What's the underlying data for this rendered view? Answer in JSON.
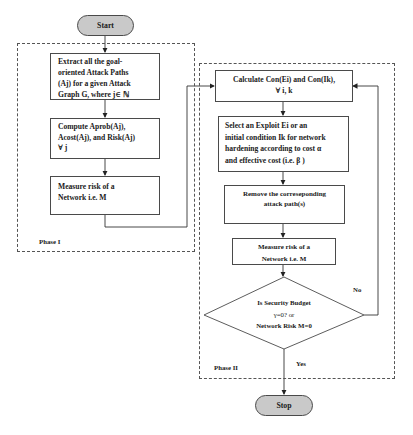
{
  "diagram": {
    "type": "flowchart",
    "terminals": {
      "start": "Start",
      "stop": "Stop"
    },
    "phase1": {
      "label": "Phase I",
      "steps": [
        {
          "id": "extract",
          "lines": [
            "Extract all the goal-",
            "oriented Attack Paths",
            "(Aj) for a given Attack",
            "Graph G, where j∈ ℕ"
          ]
        },
        {
          "id": "compute",
          "lines": [
            "Compute Aprob(Aj),",
            "Acost(Aj), and Risk(Aj)",
            "∀ j"
          ]
        },
        {
          "id": "measure1",
          "lines": [
            "Measure risk of a",
            "Network i.e. M"
          ]
        }
      ]
    },
    "phase2": {
      "label": "Phase II",
      "steps": [
        {
          "id": "calculate",
          "lines": [
            "Calculate Con(Ei) and Con(Ik),",
            "∀ i, k"
          ]
        },
        {
          "id": "select",
          "lines": [
            "Select an Exploit Ei or an",
            "initial condition Ik for network",
            "hardening according to cost α",
            "and effective cost (i.e. β )"
          ]
        },
        {
          "id": "remove",
          "lines": [
            "Remove the correseponding",
            "attack path(s)"
          ]
        },
        {
          "id": "measure2",
          "lines": [
            "Measure risk of a",
            "Network i.e. M"
          ]
        }
      ],
      "decision": {
        "lines": [
          "Is Security Budget",
          "γ=0? or",
          "Network Risk M=0"
        ],
        "yes_label": "Yes",
        "no_label": "No"
      }
    },
    "colors": {
      "terminal_fill": "#c9c9c9",
      "stroke": "#4a4a4a",
      "background": "#ffffff"
    }
  }
}
